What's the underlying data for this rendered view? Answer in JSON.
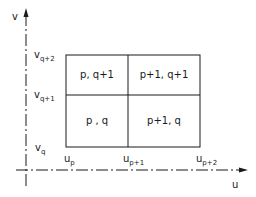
{
  "axes": {
    "x_label": "u",
    "y_label": "v"
  },
  "u_ticks": [
    {
      "base": "u",
      "sub": "p"
    },
    {
      "base": "u",
      "sub": "p+1"
    },
    {
      "base": "u",
      "sub": "p+2"
    }
  ],
  "v_ticks": [
    {
      "base": "v",
      "sub": "q"
    },
    {
      "base": "v",
      "sub": "q+1"
    },
    {
      "base": "v",
      "sub": "q+2"
    }
  ],
  "cells": {
    "bottom_left": "p , q",
    "bottom_right": "p+1, q",
    "top_left": "p, q+1",
    "top_right": "p+1, q+1"
  }
}
